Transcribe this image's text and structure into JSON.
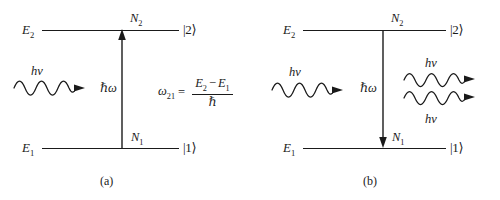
{
  "figure": {
    "type": "energy-level-diagram",
    "background_color": "#ffffff",
    "ink_color": "#1a1a1a",
    "panels": [
      {
        "id": "a",
        "caption": "(a)",
        "process": "stimulated absorption",
        "upper_level": {
          "energy_label": "E",
          "energy_sub": "2",
          "population_label": "N",
          "population_sub": "2",
          "ket": "|2⟩"
        },
        "lower_level": {
          "energy_label": "E",
          "energy_sub": "1",
          "population_label": "N",
          "population_sub": "1",
          "ket": "|1⟩"
        },
        "transition": {
          "arrow_direction": "up",
          "label": "ℏω"
        },
        "incoming_photon": {
          "label": "hν",
          "direction": "right",
          "cycles": 3
        },
        "outgoing_photons": [],
        "equation": {
          "lhs": "ω",
          "lhs_sub": "21",
          "relation": "=",
          "numerator_left": "E",
          "numerator_left_sub": "2",
          "numerator_op": "−",
          "numerator_right": "E",
          "numerator_right_sub": "1",
          "denominator": "ℏ"
        }
      },
      {
        "id": "b",
        "caption": "(b)",
        "process": "stimulated emission",
        "upper_level": {
          "energy_label": "E",
          "energy_sub": "2",
          "population_label": "N",
          "population_sub": "2",
          "ket": "|2⟩"
        },
        "lower_level": {
          "energy_label": "E",
          "energy_sub": "1",
          "population_label": "N",
          "population_sub": "1",
          "ket": "|1⟩"
        },
        "transition": {
          "arrow_direction": "down",
          "label": "ℏω"
        },
        "incoming_photon": {
          "label": "hν",
          "direction": "right",
          "cycles": 3
        },
        "outgoing_photons": [
          {
            "label": "hν",
            "direction": "right",
            "cycles": 3,
            "position": "top"
          },
          {
            "label": "hν",
            "direction": "right",
            "cycles": 3,
            "position": "bottom"
          }
        ],
        "equation": null
      }
    ]
  }
}
